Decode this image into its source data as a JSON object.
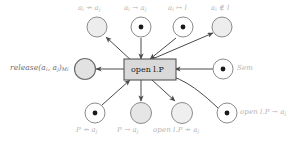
{
  "diagram": {
    "kind": "petri-net",
    "transition": {
      "label": "open l.P",
      "fill": "#d9d9d9",
      "stroke": "#555555",
      "text_color": "#1a1a1a"
    },
    "colors": {
      "place_stroke": "#8c8c8c",
      "place_fill_empty": "#ededed",
      "place_fill_plain": "#ffffff",
      "token": "#1a1a1a",
      "arc": "#4a4a4a",
      "label_gray": "#b4b4b4",
      "label_dark": "#6e6e6e",
      "background": "#ffffff"
    },
    "places": [
      {
        "id": "p-ai-nmaps-aj",
        "label": "a_i ↛ a_j",
        "label_parts": {
          "pre": "a",
          "pre_sub": "i",
          "op": "↛",
          "post": "a",
          "post_sub": "j"
        },
        "token": false,
        "shaded": true,
        "arc_direction": "out",
        "position": "top-1"
      },
      {
        "id": "p-ai-to-aj",
        "label": "a_i → a_j",
        "label_parts": {
          "pre": "a",
          "pre_sub": "i",
          "op": "→",
          "post": "a",
          "post_sub": "j"
        },
        "token": true,
        "shaded": false,
        "arc_direction": "in",
        "position": "top-2"
      },
      {
        "id": "p-ai-mapsto-l",
        "label": "a_i ↦ l",
        "label_parts": {
          "pre": "a",
          "pre_sub": "i",
          "op": "↦",
          "post": "l",
          "post_sub": ""
        },
        "token": true,
        "shaded": false,
        "arc_direction": "in",
        "position": "top-3"
      },
      {
        "id": "p-ai-notin-l",
        "label": "a_i ∉ l",
        "label_parts": {
          "pre": "a",
          "pre_sub": "i",
          "op": "∉",
          "post": "l",
          "post_sub": ""
        },
        "token": false,
        "shaded": true,
        "arc_direction": "out",
        "position": "top-4"
      },
      {
        "id": "p-release",
        "label": "release(a_i, a_j)_{M_i}",
        "label_parts": {
          "pre": "release(a",
          "pre_sub": "i",
          "op": ",",
          "post": "a",
          "post_sub": "j",
          "tail": ")",
          "tail_sub": "M_i"
        },
        "token": false,
        "shaded": true,
        "arc_direction": "out",
        "position": "left"
      },
      {
        "id": "p-sem",
        "label": "Sem",
        "label_parts": {
          "pre": "Sem",
          "pre_sub": "",
          "op": "",
          "post": "",
          "post_sub": ""
        },
        "token": true,
        "shaded": false,
        "arc_direction": "in",
        "position": "right"
      },
      {
        "id": "p-P-nmaps-aj",
        "label": "P ↛ a_j",
        "label_parts": {
          "pre": "P",
          "pre_sub": "",
          "op": "↛",
          "post": "a",
          "post_sub": "j"
        },
        "token": true,
        "shaded": false,
        "arc_direction": "in",
        "position": "bottom-1"
      },
      {
        "id": "p-P-to-aj",
        "label": "P → a_j",
        "label_parts": {
          "pre": "P",
          "pre_sub": "",
          "op": "→",
          "post": "a",
          "post_sub": "j"
        },
        "token": false,
        "shaded": true,
        "arc_direction": "out",
        "position": "bottom-2"
      },
      {
        "id": "p-openlP-nmaps-aj",
        "label": "open l.P ↛ a_j",
        "label_parts": {
          "pre": "open l.P",
          "pre_sub": "",
          "op": "↛",
          "post": "a",
          "post_sub": "j"
        },
        "token": false,
        "shaded": true,
        "arc_direction": "out",
        "position": "bottom-3"
      },
      {
        "id": "p-openlP-to-aj",
        "label": "open l.P → a_j",
        "label_parts": {
          "pre": "open l.P",
          "pre_sub": "",
          "op": "→",
          "post": "a",
          "post_sub": "j"
        },
        "token": true,
        "shaded": false,
        "arc_direction": "in",
        "position": "bottom-4"
      }
    ]
  }
}
